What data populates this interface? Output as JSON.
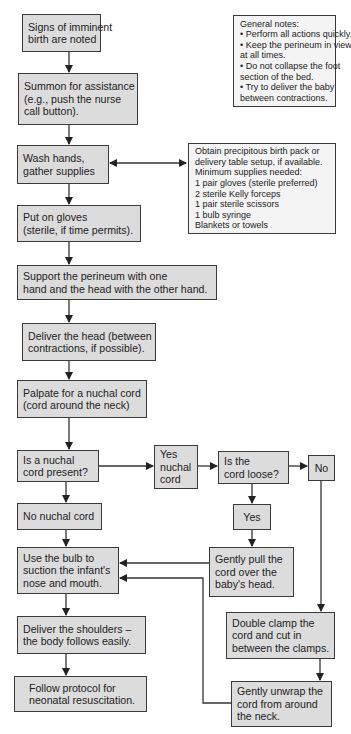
{
  "diagram": {
    "type": "flowchart",
    "colors": {
      "box_fill": "#dcdcdc",
      "note_fill": "#f4f4f4",
      "border": "#3a3a3a",
      "line": "#333333"
    },
    "nodes": {
      "signs": {
        "lines": [
          "Signs of imminent",
          "birth are noted"
        ]
      },
      "summon": {
        "lines": [
          "Summon for assistance",
          "(e.g., push the nurse",
          "call button)."
        ]
      },
      "wash": {
        "lines": [
          "Wash hands,",
          "gather supplies"
        ]
      },
      "supplies": {
        "lines": [
          "Obtain precipitous birth pack or",
          "delivery table setup, if available.",
          "Minimum supplies needed:",
          "1 pair gloves (sterile preferred)",
          "2 sterile Kelly forceps",
          "1 pair sterile scissors",
          "1 bulb syringe",
          "Blankets or towels"
        ]
      },
      "notes": {
        "lines": [
          "General notes:",
          "• Perform all actions quickly.",
          "• Keep the perineum in view",
          "  at all times.",
          "• Do not collapse the foot",
          "  section of the bed.",
          "• Try to deliver the baby",
          "  between contractions."
        ]
      },
      "gloves": {
        "lines": [
          "Put on gloves",
          "(sterile, if time permits)."
        ]
      },
      "support": {
        "lines": [
          "Support the perineum with one",
          "hand and the head with the other hand."
        ]
      },
      "head": {
        "lines": [
          "Deliver the head (between",
          "contractions, if possible)."
        ]
      },
      "palpate": {
        "lines": [
          "Palpate for a nuchal cord",
          "(cord around the neck)"
        ]
      },
      "nuchal_q": {
        "lines": [
          "Is a nuchal",
          "cord present?"
        ]
      },
      "yes_nuchal": {
        "lines": [
          "Yes",
          "nuchal",
          "cord"
        ]
      },
      "loose_q": {
        "lines": [
          "Is the",
          "cord loose?"
        ]
      },
      "no": {
        "lines": [
          "No"
        ]
      },
      "no_nuchal": {
        "lines": [
          "No nuchal cord"
        ]
      },
      "yes": {
        "lines": [
          "Yes"
        ]
      },
      "bulb": {
        "lines": [
          "Use the bulb to",
          "suction the infant's",
          "nose and mouth."
        ]
      },
      "pull": {
        "lines": [
          "Gently pull the",
          "cord over the",
          "baby's head."
        ]
      },
      "shoulders": {
        "lines": [
          "Deliver the shoulders –",
          "the body follows easily."
        ]
      },
      "clamp": {
        "lines": [
          "Double clamp the",
          "cord and cut in",
          "between the clamps."
        ]
      },
      "follow": {
        "lines": [
          "Follow protocol for",
          "neonatal resuscitation."
        ]
      },
      "unwrap": {
        "lines": [
          "Gently unwrap the",
          "cord from around",
          "the neck."
        ]
      }
    },
    "edges": [
      [
        "signs",
        "summon"
      ],
      [
        "summon",
        "wash"
      ],
      [
        "wash",
        "supplies",
        "bidirectional"
      ],
      [
        "wash",
        "gloves"
      ],
      [
        "gloves",
        "support"
      ],
      [
        "support",
        "head"
      ],
      [
        "head",
        "palpate"
      ],
      [
        "palpate",
        "nuchal_q"
      ],
      [
        "nuchal_q",
        "yes_nuchal"
      ],
      [
        "yes_nuchal",
        "loose_q"
      ],
      [
        "loose_q",
        "no"
      ],
      [
        "loose_q",
        "yes"
      ],
      [
        "nuchal_q",
        "no_nuchal"
      ],
      [
        "yes",
        "pull"
      ],
      [
        "no_nuchal",
        "bulb"
      ],
      [
        "pull",
        "bulb"
      ],
      [
        "no",
        "clamp"
      ],
      [
        "clamp",
        "unwrap"
      ],
      [
        "unwrap",
        "bulb"
      ],
      [
        "bulb",
        "shoulders"
      ],
      [
        "shoulders",
        "follow"
      ]
    ]
  }
}
